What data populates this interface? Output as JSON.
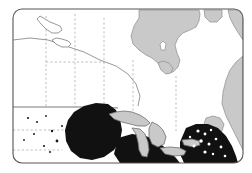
{
  "figure": {
    "kind": "thematic-range-map",
    "title": "",
    "caption": "",
    "region_name": "Eastern Canada and Great Lakes region",
    "frame": {
      "shape": "rounded-rectangle",
      "x": 13,
      "y": 9,
      "width": 230,
      "height": 154,
      "corner_radius": 9,
      "stroke_color": "#555555",
      "stroke_width": 1,
      "fill_color": "#ffffff"
    }
  },
  "colors": {
    "land_fill": "#ffffff",
    "water_fill": "#c9c9c9",
    "water_stroke": "#8c8c8c",
    "shaded_range_fill": "#111111",
    "border_line": "#6b6b6b",
    "internal_boundary": "#8a8a8a",
    "frame_stroke": "#555555",
    "page_background": "#ffffff"
  },
  "legend": {
    "present": false,
    "entries": [
      {
        "label": "Shaded distribution area",
        "swatch_color": "#111111"
      },
      {
        "label": "Water body",
        "swatch_color": "#c9c9c9"
      },
      {
        "label": "Land",
        "swatch_color": "#ffffff"
      }
    ]
  },
  "map_layers": {
    "water_bodies": [
      {
        "name": "hudson-bay",
        "label": "Hudson Bay"
      },
      {
        "name": "james-bay",
        "label": "James Bay"
      },
      {
        "name": "ungava-bay",
        "label": "Ungava Bay"
      },
      {
        "name": "lake-winnipeg",
        "label": "Lake Winnipeg"
      },
      {
        "name": "lake-superior",
        "label": "Lake Superior"
      },
      {
        "name": "lake-michigan",
        "label": "Lake Michigan"
      },
      {
        "name": "lake-huron",
        "label": "Lake Huron"
      },
      {
        "name": "lake-erie",
        "label": "Lake Erie"
      },
      {
        "name": "lake-ontario",
        "label": "Lake Ontario"
      },
      {
        "name": "gulf-of-saint-lawrence",
        "label": "Gulf of St. Lawrence"
      },
      {
        "name": "atlantic-ocean",
        "label": "Atlantic Ocean"
      }
    ],
    "boundaries": [
      {
        "name": "international-border",
        "style": "solid"
      },
      {
        "name": "provincial-border",
        "style": "dashed"
      },
      {
        "name": "state-border",
        "style": "dashed"
      }
    ],
    "shaded_regions": [
      {
        "name": "western-shaded-lobe",
        "description": "Large solid black area south and west of Lake Superior"
      },
      {
        "name": "central-shaded-band",
        "description": "Black band along the southern shores of Lakes Michigan, Huron and Erie"
      },
      {
        "name": "eastern-shaded-lobe",
        "description": "Black area over the northeastern seaboard with white speckling"
      }
    ]
  },
  "map_paths": {
    "hudson_bay": "M 139 10 L 139 18 L 134 26 L 131 36 L 133 44 L 139 50 L 146 55 L 152 58 L 158 63 L 162 70 L 167 73 L 173 72 L 178 67 L 180 60 L 177 53 L 175 45 L 178 38 L 183 33 L 190 30 L 196 27 L 199 21 L 200 14 L 199 10 Z",
    "hudson_bay_inner": "M 160 44 L 163 41 L 166 44 L 165 50 L 161 50 Z",
    "james_bay": "M 158 63 L 161 70 L 166 74 L 171 73 L 173 68 L 169 63 L 163 61 Z",
    "ungava_bay": "M 204 10 L 205 17 L 210 22 L 217 22 L 222 17 L 222 10 Z",
    "labrador_sea": "M 228 10 L 230 18 L 234 26 L 239 34 L 243 40 L 243 10 Z",
    "atlantic_east": "M 243 56 L 236 62 L 230 70 L 226 80 L 223 92 L 222 104 L 226 116 L 232 128 L 238 140 L 243 150 Z",
    "lake_winnipeg": "M 37 19 L 41 24 L 46 29 L 52 33 L 58 33 L 62 30 L 60 26 L 55 24 L 50 22 L 45 19 L 40 16 Z",
    "lake_winnipeg_south": "M 52 40 L 56 44 L 62 47 L 68 47 L 71 44 L 68 41 L 62 39 L 56 38 Z",
    "lake_superior": "M 109 114 L 116 112 L 124 111 L 132 112 L 140 115 L 146 119 L 150 123 L 146 126 L 138 126 L 130 124 L 122 122 L 114 119 Z",
    "lake_michigan": "M 132 128 L 136 134 L 138 142 L 139 150 L 142 156 L 147 157 L 149 150 L 148 142 L 145 134 L 140 129 Z",
    "lake_huron": "M 152 122 L 158 125 L 163 130 L 166 137 L 164 144 L 158 147 L 152 144 L 149 137 L 149 128 Z",
    "lake_erie": "M 160 148 L 170 147 L 180 148 L 186 151 L 184 155 L 175 156 L 165 154 Z",
    "lake_ontario": "M 182 140 L 192 139 L 199 141 L 200 145 L 193 147 L 184 145 Z",
    "gulf_st_lawrence": "M 206 118 L 213 116 L 220 118 L 224 124 L 222 131 L 215 133 L 208 130 L 204 124 Z",
    "shaded_west": "M 68 120 L 74 112 L 84 106 L 96 103 L 108 104 L 116 110 L 120 119 L 122 130 L 120 141 L 114 150 L 104 157 L 92 160 L 80 158 L 71 151 L 66 141 L 65 130 Z",
    "shaded_center": "M 118 138 L 132 134 L 146 136 L 158 142 L 168 150 L 176 158 L 180 163 L 120 163 L 114 154 Z",
    "shaded_east": "M 186 128 L 196 124 L 208 124 L 218 128 L 226 136 L 232 146 L 236 156 L 238 163 L 184 163 L 180 154 L 180 142 Z",
    "coast_main": "M 13 40 L 30 38 L 48 40 L 66 46 L 84 52 L 100 60 L 116 66 L 128 74 L 136 84 L 140 96 L 138 106",
    "border_49th": "M 13 107 L 40 107 L 70 107 L 100 107 L 118 108",
    "boundary_v1": "M 46 16 L 46 46 L 46 76 L 46 107",
    "boundary_v2": "M 75 14 L 75 44 L 75 74 L 75 107",
    "boundary_v3": "M 104 18 L 104 48 L 104 78 L 104 104",
    "boundary_v4": "M 133 60 L 133 80 L 133 100 L 133 112",
    "boundary_v5": "M 176 76 L 176 96 L 176 116 L 176 132",
    "boundary_h1": "M 13 130 L 45 130 L 75 130 L 100 130",
    "boundary_h2": "M 13 150 L 40 150 L 62 150",
    "boundary_h3": "M 46 62 L 75 62 L 104 62"
  },
  "speckles": {
    "description": "Small white voids inside the eastern shaded lobe and small black marks in the western plains",
    "white_dots": [
      {
        "cx": 198,
        "cy": 131,
        "r": 1.6
      },
      {
        "cx": 205,
        "cy": 134,
        "r": 1.4
      },
      {
        "cx": 211,
        "cy": 130,
        "r": 1.2
      },
      {
        "cx": 201,
        "cy": 141,
        "r": 1.8
      },
      {
        "cx": 209,
        "cy": 144,
        "r": 1.5
      },
      {
        "cx": 216,
        "cy": 139,
        "r": 1.3
      },
      {
        "cx": 194,
        "cy": 146,
        "r": 1.4
      },
      {
        "cx": 205,
        "cy": 152,
        "r": 1.6
      },
      {
        "cx": 213,
        "cy": 154,
        "r": 1.2
      },
      {
        "cx": 221,
        "cy": 147,
        "r": 1.4
      },
      {
        "cx": 190,
        "cy": 137,
        "r": 1.2
      },
      {
        "cx": 225,
        "cy": 156,
        "r": 1.3
      }
    ],
    "black_dots": [
      {
        "cx": 28,
        "cy": 118,
        "r": 1.1
      },
      {
        "cx": 37,
        "cy": 122,
        "r": 1.0
      },
      {
        "cx": 46,
        "cy": 116,
        "r": 0.9
      },
      {
        "cx": 34,
        "cy": 134,
        "r": 1.0
      },
      {
        "cx": 52,
        "cy": 131,
        "r": 1.2
      },
      {
        "cx": 57,
        "cy": 141,
        "r": 1.4
      },
      {
        "cx": 44,
        "cy": 146,
        "r": 1.1
      },
      {
        "cx": 62,
        "cy": 126,
        "r": 1.0
      },
      {
        "cx": 24,
        "cy": 140,
        "r": 0.9
      },
      {
        "cx": 50,
        "cy": 152,
        "r": 1.0
      }
    ]
  }
}
